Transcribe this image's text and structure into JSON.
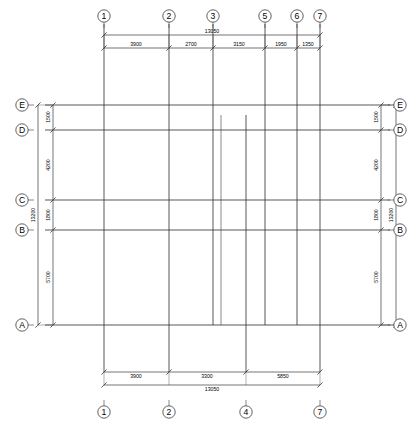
{
  "drawing": {
    "type": "structural-column-grid-plan",
    "units": "mm",
    "line_color": "#3a3a3a",
    "text_color": "#000000",
    "background": "#ffffff"
  },
  "grid_lines": {
    "vertical": [
      {
        "label": "1",
        "x": 104,
        "top_bubble": true,
        "bottom_bubble": true,
        "y_start": 24,
        "y_end": 372
      },
      {
        "label": "2",
        "x": 169,
        "top_bubble": true,
        "bottom_bubble": true,
        "y_start": 24,
        "y_end": 372
      },
      {
        "label": "3",
        "x": 213,
        "top_bubble": true,
        "bottom_bubble": false,
        "y_start": 24,
        "y_end": 325
      },
      {
        "label": "4",
        "x": 246,
        "top_bubble": false,
        "bottom_bubble": true,
        "y_start": 115,
        "y_end": 372
      },
      {
        "label": "5",
        "x": 265,
        "top_bubble": true,
        "bottom_bubble": false,
        "y_start": 24,
        "y_end": 325
      },
      {
        "label": "6",
        "x": 297,
        "top_bubble": true,
        "bottom_bubble": false,
        "y_start": 24,
        "y_end": 325
      },
      {
        "label": "7",
        "x": 320,
        "top_bubble": true,
        "bottom_bubble": true,
        "y_start": 24,
        "y_end": 372
      }
    ],
    "horizontal": [
      {
        "label": "E",
        "y": 105,
        "x_start": 45,
        "x_end": 390
      },
      {
        "label": "D",
        "y": 130,
        "x_start": 45,
        "x_end": 390
      },
      {
        "label": "C",
        "y": 200,
        "x_start": 45,
        "x_end": 390
      },
      {
        "label": "B",
        "y": 230,
        "x_start": 45,
        "x_end": 390
      },
      {
        "label": "A",
        "y": 325,
        "x_start": 45,
        "x_end": 390
      }
    ],
    "inner_short_line": {
      "x": 221,
      "y_start": 115,
      "y_end": 325
    }
  },
  "dimensions": {
    "top": {
      "overall": {
        "value": "13050",
        "x": 212,
        "y": 33
      },
      "chain": [
        {
          "value": "3900",
          "from": "1",
          "to": "2",
          "x": 136,
          "y": 46
        },
        {
          "value": "2700",
          "from": "2",
          "to": "3",
          "x": 191,
          "y": 46
        },
        {
          "value": "3150",
          "from": "3",
          "to": "5",
          "x": 239,
          "y": 46
        },
        {
          "value": "1950",
          "from": "5",
          "to": "6",
          "x": 281,
          "y": 46
        },
        {
          "value": "1350",
          "from": "6",
          "to": "7",
          "x": 308,
          "y": 46
        }
      ]
    },
    "bottom": {
      "overall": {
        "value": "13050",
        "x": 212,
        "y": 391
      },
      "chain": [
        {
          "value": "3900",
          "from": "1",
          "to": "2",
          "x": 136,
          "y": 378
        },
        {
          "value": "3300",
          "from": "2",
          "to": "4",
          "x": 207,
          "y": 378
        },
        {
          "value": "5850",
          "from": "4",
          "to": "7",
          "x": 283,
          "y": 378
        }
      ]
    },
    "left": {
      "overall": {
        "value": "13200",
        "x": 33,
        "y": 215
      },
      "chain": [
        {
          "value": "1500",
          "from": "E",
          "to": "D",
          "x": 47,
          "y": 117
        },
        {
          "value": "4200",
          "from": "D",
          "to": "C",
          "x": 47,
          "y": 165
        },
        {
          "value": "1800",
          "from": "C",
          "to": "B",
          "x": 47,
          "y": 215
        },
        {
          "value": "5700",
          "from": "B",
          "to": "A",
          "x": 47,
          "y": 277
        }
      ]
    },
    "right": {
      "overall": {
        "value": "13200",
        "x": 400,
        "y": 215
      },
      "chain": [
        {
          "value": "1500",
          "from": "E",
          "to": "D",
          "x": 387,
          "y": 117
        },
        {
          "value": "4200",
          "from": "D",
          "to": "C",
          "x": 387,
          "y": 165
        },
        {
          "value": "1800",
          "from": "C",
          "to": "B",
          "x": 387,
          "y": 215
        },
        {
          "value": "5700",
          "from": "B",
          "to": "A",
          "x": 387,
          "y": 277
        }
      ]
    }
  },
  "bubbles": {
    "top": [
      {
        "label": "1",
        "x": 104
      },
      {
        "label": "2",
        "x": 169
      },
      {
        "label": "3",
        "x": 213
      },
      {
        "label": "5",
        "x": 265
      },
      {
        "label": "6",
        "x": 297
      },
      {
        "label": "7",
        "x": 320
      }
    ],
    "bottom": [
      {
        "label": "1",
        "x": 104
      },
      {
        "label": "2",
        "x": 169
      },
      {
        "label": "4",
        "x": 246
      },
      {
        "label": "7",
        "x": 320
      }
    ],
    "left": [
      {
        "label": "E",
        "y": 105
      },
      {
        "label": "D",
        "y": 130
      },
      {
        "label": "C",
        "y": 200
      },
      {
        "label": "B",
        "y": 230
      },
      {
        "label": "A",
        "y": 325
      }
    ],
    "right": [
      {
        "label": "E",
        "y": 105
      },
      {
        "label": "D",
        "y": 130
      },
      {
        "label": "C",
        "y": 200
      },
      {
        "label": "B",
        "y": 230
      },
      {
        "label": "A",
        "y": 325
      }
    ]
  }
}
